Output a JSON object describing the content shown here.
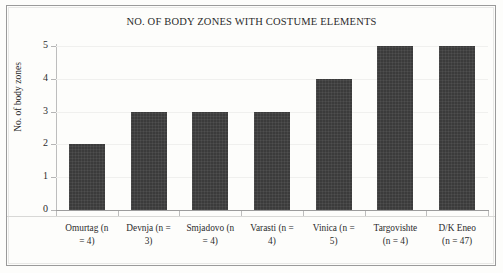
{
  "chart_data": {
    "type": "bar",
    "title": "NO. OF BODY ZONES WITH COSTUME ELEMENTS",
    "xlabel": "",
    "ylabel": "No. of body zones",
    "categories": [
      "Omurtag (n = 4)",
      "Devnja (n = 3)",
      "Smjadovo (n = 4)",
      "Varasti (n = 4)",
      "Vinica (n = 5)",
      "Targovishte (n = 4)",
      "D/K Eneo (n = 47)"
    ],
    "category_lines": [
      [
        "Omurtag (n",
        "= 4)"
      ],
      [
        "Devnja (n =",
        "3)"
      ],
      [
        "Smjadovo (n",
        "= 4)"
      ],
      [
        "Varasti (n =",
        "4)"
      ],
      [
        "Vinica (n =",
        "5)"
      ],
      [
        "Targovishte",
        "(n = 4)"
      ],
      [
        "D/K Eneo",
        "(n = 47)"
      ]
    ],
    "values": [
      2,
      3,
      3,
      3,
      4,
      5,
      5
    ],
    "ylim": [
      0,
      5
    ],
    "yticks": [
      0,
      1,
      2,
      3,
      4,
      5
    ],
    "ytick_labels": [
      "0",
      "1",
      "2",
      "3",
      "4",
      "5"
    ],
    "grid": true,
    "legend": false,
    "bar_color": "#3b3b3b",
    "background_color": "#fdfdfb",
    "axis_color": "#9c9c9c",
    "text_color": "#2b2b2b"
  }
}
